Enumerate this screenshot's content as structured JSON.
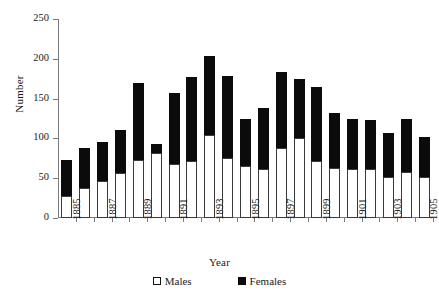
{
  "chart_data": {
    "type": "bar",
    "subtype": "stacked-vertical",
    "title": "",
    "xlabel": "Year",
    "ylabel": "Number",
    "ylim": [
      0,
      250
    ],
    "yticks": [
      0,
      50,
      100,
      150,
      200,
      250
    ],
    "ytick_labels": [
      "0",
      "50",
      "100",
      "150",
      "200",
      "250"
    ],
    "grid": false,
    "legend_position": "bottom-center",
    "categories": [
      "1885",
      "1886",
      "1887",
      "1888",
      "1889",
      "1890",
      "1891",
      "1892",
      "1893",
      "1894",
      "1895",
      "1896",
      "1897",
      "1898",
      "1899",
      "1900",
      "1901",
      "1902",
      "1903",
      "1904",
      "1905"
    ],
    "xtick_labels_shown": [
      "1885",
      "",
      "1887",
      "",
      "1889",
      "",
      "1891",
      "",
      "1893",
      "",
      "1895",
      "",
      "1897",
      "",
      "1899",
      "",
      "1901",
      "",
      "1903",
      "",
      "1905"
    ],
    "series": [
      {
        "name": "Males",
        "color": "#ffffff",
        "edge_color": "#3a3a3a",
        "values": [
          28,
          38,
          47,
          57,
          73,
          82,
          68,
          72,
          104,
          76,
          65,
          62,
          88,
          100,
          72,
          63,
          62,
          62,
          52,
          58,
          52
        ]
      },
      {
        "name": "Females",
        "color": "#0b0b0b",
        "edge_color": "#0b0b0b",
        "values": [
          45,
          50,
          48,
          53,
          97,
          11,
          89,
          105,
          99,
          102,
          59,
          76,
          95,
          75,
          93,
          69,
          62,
          61,
          55,
          67,
          50
        ]
      }
    ],
    "totals": [
      73,
      88,
      95,
      110,
      170,
      93,
      157,
      177,
      203,
      178,
      124,
      138,
      183,
      175,
      165,
      132,
      124,
      123,
      107,
      125,
      102
    ]
  },
  "legend": {
    "items": [
      {
        "label": "Males",
        "swatch": "white-square"
      },
      {
        "label": "Females",
        "swatch": "black-square"
      }
    ]
  },
  "axes": {
    "x_title": "Year",
    "y_title": "Number"
  }
}
